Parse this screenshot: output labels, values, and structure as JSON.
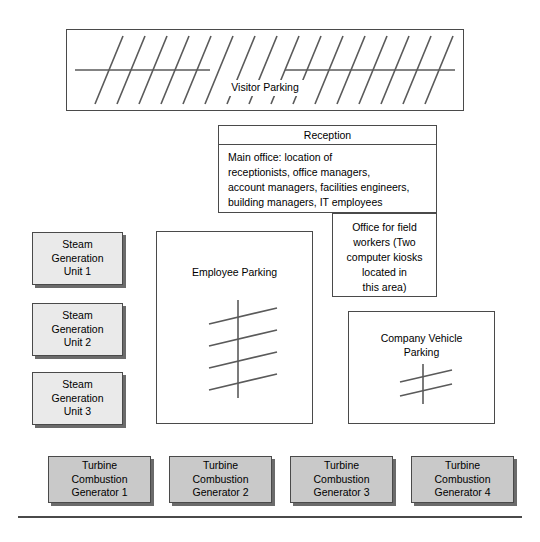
{
  "diagram": {
    "type": "site-layout-diagram",
    "areas": {
      "visitor_parking": {
        "label": "Visitor Parking",
        "stall_rows": 17
      },
      "reception": {
        "title": "Reception",
        "body_lines": [
          "Main office: location of",
          "receptionists, office managers,",
          "account managers, facilities engineers,",
          "building managers, IT employees"
        ]
      },
      "field_office": {
        "body_lines": [
          "Office for field",
          "workers (Two",
          "computer kiosks",
          "located in",
          "this area)"
        ]
      },
      "employee_parking": {
        "label": "Employee Parking",
        "stall_rows": 4
      },
      "company_vehicle_parking": {
        "label_lines": [
          "Company Vehicle",
          "Parking"
        ],
        "stall_rows": 2
      }
    },
    "steam_units": [
      {
        "lines": [
          "Steam",
          "Generation",
          "Unit 1"
        ]
      },
      {
        "lines": [
          "Steam",
          "Generation",
          "Unit 2"
        ]
      },
      {
        "lines": [
          "Steam",
          "Generation",
          "Unit 3"
        ]
      }
    ],
    "turbines": [
      {
        "lines": [
          "Turbine",
          "Combustion",
          "Generator 1"
        ]
      },
      {
        "lines": [
          "Turbine",
          "Combustion",
          "Generator 2"
        ]
      },
      {
        "lines": [
          "Turbine",
          "Combustion",
          "Generator 3"
        ]
      },
      {
        "lines": [
          "Turbine",
          "Combustion",
          "Generator 4"
        ]
      }
    ],
    "colors": {
      "steam_fill": "#eaeaea",
      "turbine_fill": "#c9c9c9",
      "outline": "#4a4a4a",
      "mark_stroke": "#5a5a5a",
      "background": "#ffffff"
    }
  }
}
